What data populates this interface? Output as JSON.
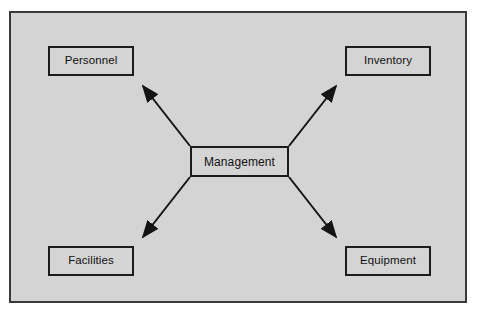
{
  "diagram": {
    "center": {
      "id": "management",
      "label": "Management"
    },
    "nodes": [
      {
        "id": "personnel",
        "label": "Personnel",
        "position": "top-left"
      },
      {
        "id": "inventory",
        "label": "Inventory",
        "position": "top-right"
      },
      {
        "id": "facilities",
        "label": "Facilities",
        "position": "bottom-left"
      },
      {
        "id": "equipment",
        "label": "Equipment",
        "position": "bottom-right"
      }
    ],
    "connectors": [
      {
        "from": "management",
        "to": "personnel",
        "style": "single-arrow",
        "direction": "outward"
      },
      {
        "from": "management",
        "to": "inventory",
        "style": "single-arrow",
        "direction": "outward"
      },
      {
        "from": "management",
        "to": "facilities",
        "style": "single-arrow",
        "direction": "outward"
      },
      {
        "from": "management",
        "to": "equipment",
        "style": "single-arrow",
        "direction": "outward"
      }
    ],
    "colors": {
      "frame_border": "#3a3a3a",
      "field_background": "#d4d4d4",
      "box_border": "#1c1c1c",
      "box_background": "#d4d4d4",
      "line": "#141414",
      "text": "#111111",
      "page_background": "#ffffff"
    }
  }
}
